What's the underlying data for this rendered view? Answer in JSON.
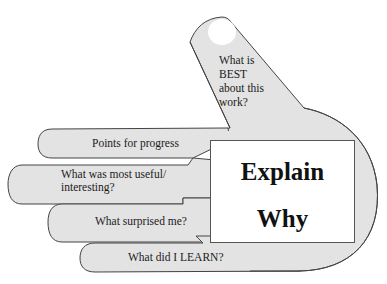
{
  "diagram": {
    "type": "hand-reflection-prompt",
    "colors": {
      "hand_fill": "#e3e3e3",
      "outline": "#444444",
      "box_fill": "#ffffff",
      "text": "#1a1a1a"
    },
    "thumb": {
      "line1": "What is",
      "line2": "BEST",
      "line3": "about this",
      "line4": "work?"
    },
    "fingers": [
      {
        "label": "Points for progress"
      },
      {
        "line1": "What was most useful/",
        "line2": "interesting?"
      },
      {
        "label": "What surprised me?"
      },
      {
        "label": "What did I LEARN?"
      }
    ],
    "palm_box": {
      "line1": "Explain",
      "line2": "Why"
    }
  }
}
